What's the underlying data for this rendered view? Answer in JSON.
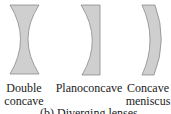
{
  "figure": {
    "lenses": [
      {
        "name": "Double concave",
        "label_lines": [
          "Double",
          "concave"
        ]
      },
      {
        "name": "Planoconcave",
        "label_lines": [
          "Planoconcave"
        ]
      },
      {
        "name": "Concave meniscus",
        "label_lines": [
          "Concave",
          "meniscus"
        ]
      }
    ],
    "caption": "(b) Diverging lenses",
    "colors": {
      "lens_fill": "#cfcfcf",
      "lens_stroke": "#8a8a8a"
    }
  }
}
